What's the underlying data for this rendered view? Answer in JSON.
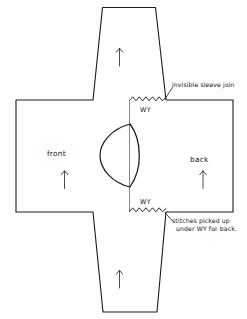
{
  "diagram": {
    "ink_color": "#1a1a1a",
    "paper_color": "#ffffff",
    "panels": {
      "front_label": "front",
      "back_label": "back"
    },
    "waste_yarn": {
      "top_label": "WY",
      "bottom_label": "WY"
    },
    "annotations": {
      "sleeve_join": "invisible sleeve join",
      "picked_up_line1": "stitches  picked  up",
      "picked_up_line2": "under WY for back."
    },
    "arrows": {
      "top_sleeve": "up-arrow",
      "front_panel": "up-arrow",
      "back_panel": "up-arrow",
      "bottom_sleeve": "up-arrow",
      "direction": "up"
    }
  }
}
